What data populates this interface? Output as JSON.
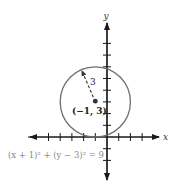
{
  "diagram": {
    "type": "coordinate-plane-circle",
    "axes": {
      "x_label": "x",
      "y_label": "y",
      "x_ticks": [
        -5,
        -4,
        -3,
        -2,
        -1,
        1,
        2,
        3
      ],
      "y_ticks": [
        -2,
        -1,
        1,
        2,
        3,
        4,
        5,
        6,
        7
      ]
    },
    "circle": {
      "center": [
        -1,
        3
      ],
      "radius": 3,
      "center_label": "(−1, 3)",
      "radius_label": "3",
      "equation": "(x + 1)² + (y − 3)² = 9"
    },
    "colors": {
      "axis": "#1a1a1a",
      "circle": "#6e6e6e",
      "equation_text": "#8a8a8a"
    }
  }
}
